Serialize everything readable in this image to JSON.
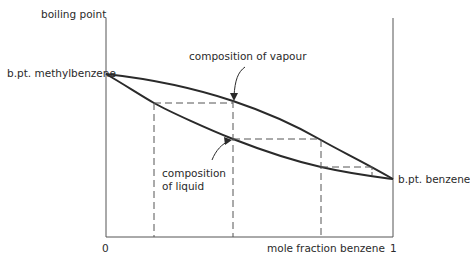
{
  "diagram": {
    "type": "boiling point / composition diagram",
    "y_axis_label": "boiling point",
    "x_axis_label": "mole fraction benzene",
    "x_tick_start": "0",
    "x_tick_end": "1",
    "left_point_label": "b.pt. methylbenzene",
    "right_point_label": "b.pt. benzene",
    "vapour_curve_label": "composition of vapour",
    "liquid_curve_label_line1": "composition",
    "liquid_curve_label_line2": "of liquid",
    "colors": {
      "line": "#2a2a2a",
      "axis": "#555555",
      "dashed": "#555555",
      "background": "#ffffff"
    }
  }
}
